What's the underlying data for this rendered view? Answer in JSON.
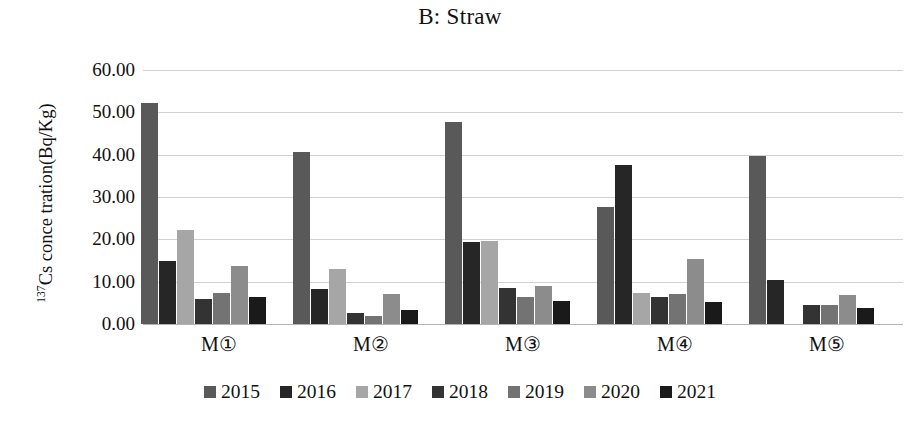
{
  "chart_data": {
    "type": "bar",
    "title": "B: Straw",
    "xlabel": "",
    "ylabel_prefix": "137",
    "ylabel_rest": "Cs conce tration(Bq/Kg)",
    "ylabel_plain": "137Cs conce tration(Bq/Kg)",
    "categories": [
      "M①",
      "M②",
      "M③",
      "M④",
      "M⑤"
    ],
    "ylim": [
      0,
      60
    ],
    "ytick_labels": [
      "60.00",
      "50.00",
      "40.00",
      "30.00",
      "20.00",
      "10.00",
      "0.00"
    ],
    "ytick_values": [
      60,
      50,
      40,
      30,
      20,
      10,
      0
    ],
    "grid": true,
    "legend_position": "bottom",
    "series": [
      {
        "name": "2015",
        "color": "#595959",
        "values": [
          52.3,
          40.7,
          47.8,
          27.6,
          39.7
        ]
      },
      {
        "name": "2016",
        "color": "#262626",
        "values": [
          14.9,
          8.3,
          19.4,
          37.5,
          10.4
        ]
      },
      {
        "name": "2017",
        "color": "#a6a6a6",
        "values": [
          22.2,
          13.0,
          19.6,
          7.3,
          null
        ]
      },
      {
        "name": "2018",
        "color": "#333333",
        "values": [
          6.0,
          2.6,
          8.5,
          6.4,
          4.4
        ]
      },
      {
        "name": "2019",
        "color": "#737373",
        "values": [
          7.3,
          1.8,
          6.3,
          7.2,
          4.4
        ]
      },
      {
        "name": "2020",
        "color": "#8c8c8c",
        "values": [
          13.6,
          7.0,
          9.0,
          15.3,
          6.8
        ]
      },
      {
        "name": "2021",
        "color": "#1a1a1a",
        "values": [
          6.4,
          3.4,
          5.4,
          5.2,
          3.9
        ]
      }
    ]
  }
}
